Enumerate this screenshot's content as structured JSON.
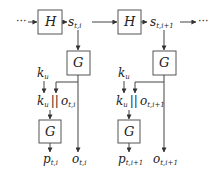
{
  "diagram": {
    "continuation_left": "···",
    "continuation_right": "···",
    "stages": [
      {
        "hash_box": "H",
        "state_label": "s",
        "state_sub": "t,i",
        "gen_top_box": "G",
        "key_label": "k",
        "key_sub": "u",
        "concat_key": "k",
        "concat_key_sub": "u",
        "concat_op": "||",
        "concat_out": "o",
        "concat_out_sub": "t,i",
        "gen_bottom_box": "G",
        "p_label": "p",
        "p_sub": "t,i",
        "o_label": "o",
        "o_sub": "t,i"
      },
      {
        "hash_box": "H",
        "state_label": "s",
        "state_sub": "t,i+1",
        "gen_top_box": "G",
        "key_label": "k",
        "key_sub": "u",
        "concat_key": "k",
        "concat_key_sub": "u",
        "concat_op": "||",
        "concat_out": "o",
        "concat_out_sub": "t,i+1",
        "gen_bottom_box": "G",
        "p_label": "p",
        "p_sub": "t,i+1",
        "o_label": "o",
        "o_sub": "t,i+1"
      }
    ],
    "colors": {
      "stroke": "#444444",
      "text": "#222222",
      "background": "#ffffff"
    }
  }
}
